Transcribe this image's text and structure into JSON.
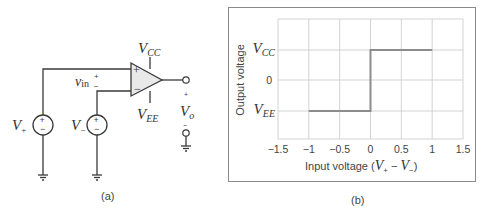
{
  "panel_a": {
    "caption": "(a)",
    "labels": {
      "vcc_main": "V",
      "vcc_sub": "CC",
      "vee_main": "V",
      "vee_sub": "EE",
      "vin_main": "v",
      "vin_sub": "in",
      "vin_plus": "+",
      "vin_minus": "−",
      "vo_main": "V",
      "vo_sub": "o",
      "vo_plus": "+",
      "vo_minus": "−",
      "vplus_main": "V",
      "vplus_sub": "+",
      "vminus_main": "V",
      "vminus_sub": "−",
      "opamp_plus": "+",
      "opamp_minus": "−",
      "source_plus": "+",
      "source_minus": "−"
    }
  },
  "panel_b": {
    "caption": "(b)"
  },
  "chart_data": {
    "type": "line",
    "title": "",
    "xlabel": "Input voltage (V+ − V−)",
    "xlabel_parts": {
      "prefix": "Input voltage (",
      "v1": "V",
      "s1": "+",
      "op": " − ",
      "v2": "V",
      "s2": "−",
      "suffix": ")"
    },
    "ylabel": "Output voltage",
    "xlim": [
      -1.5,
      1.5
    ],
    "x_ticks": [
      "−1.5",
      "−1",
      "−0.5",
      "0",
      "0.5",
      "1",
      "1.5"
    ],
    "y_ticks": [
      {
        "main": "V",
        "sub": "CC",
        "level": "VCC"
      },
      {
        "main": "0",
        "sub": "",
        "level": "0"
      },
      {
        "main": "V",
        "sub": "EE",
        "level": "VEE"
      }
    ],
    "grid": true,
    "series": [
      {
        "name": "Output",
        "x": [
          -1,
          0,
          0,
          1
        ],
        "y": [
          "VEE",
          "VEE",
          "VCC",
          "VCC"
        ],
        "color": "#8c8c8c"
      }
    ]
  }
}
